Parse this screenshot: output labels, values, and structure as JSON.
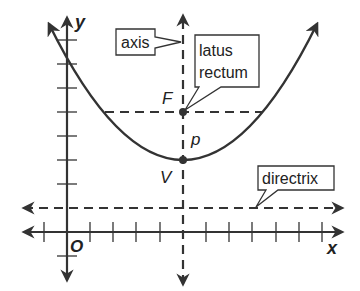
{
  "axes": {
    "x_label": "x",
    "y_label": "y",
    "origin_label": "O"
  },
  "points": {
    "focus": "F",
    "vertex": "V",
    "distance": "p"
  },
  "callouts": {
    "axis": "axis",
    "latus_rectum_line1": "latus",
    "latus_rectum_line2": "rectum",
    "directrix": "directrix"
  },
  "colors": {
    "stroke": "#333333",
    "background": "#ffffff"
  }
}
